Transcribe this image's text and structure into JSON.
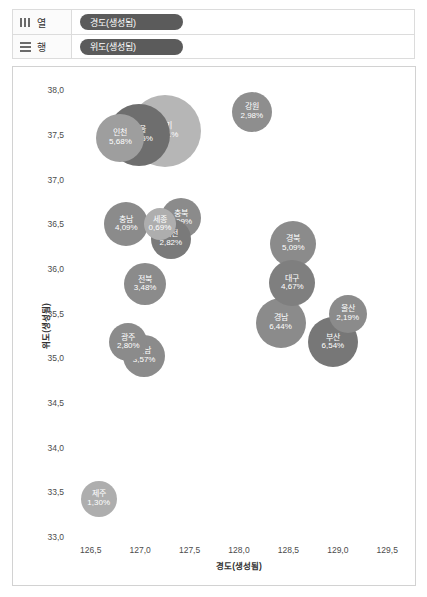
{
  "shelves": [
    {
      "icon": "columns-icon",
      "label": "열",
      "pill": "경도(생성됨)"
    },
    {
      "icon": "rows-icon",
      "label": "행",
      "pill": "위도(생성됨)"
    }
  ],
  "chart_data": {
    "type": "scatter",
    "title": "",
    "xlabel": "경도(생성됨)",
    "ylabel": "위도(생성됨)",
    "xlim": [
      126.3,
      129.7
    ],
    "ylim": [
      33.0,
      38.15
    ],
    "xticks": [
      "126,5",
      "127,0",
      "127,5",
      "128,0",
      "128,5",
      "129,0",
      "129,5"
    ],
    "xtick_values": [
      126.5,
      127.0,
      127.5,
      128.0,
      128.5,
      129.0,
      129.5
    ],
    "yticks": [
      "38,0",
      "37,5",
      "37,0",
      "36,5",
      "36,0",
      "35,5",
      "35,0",
      "34,5",
      "34,0",
      "33,5",
      "33,0"
    ],
    "ytick_values": [
      38.0,
      37.5,
      37.0,
      36.5,
      36.0,
      35.5,
      35.0,
      34.5,
      34.0,
      33.5,
      33.0
    ],
    "grid": false,
    "legend": "none",
    "size_encoding": "percent",
    "points": [
      {
        "label": "경기",
        "value": "25,91%",
        "pct": 25.91,
        "x": 127.25,
        "y": 37.55,
        "r": 36,
        "color": "#b6b6b6"
      },
      {
        "label": "서울",
        "value": "18,65%",
        "pct": 18.65,
        "x": 126.99,
        "y": 37.5,
        "r": 31,
        "color": "#6e6e6e"
      },
      {
        "label": "인천",
        "value": "5,68%",
        "pct": 5.68,
        "x": 126.8,
        "y": 37.47,
        "r": 24,
        "color": "#9e9e9e"
      },
      {
        "label": "강원",
        "value": "2,98%",
        "pct": 2.98,
        "x": 128.13,
        "y": 37.76,
        "r": 20,
        "color": "#8e8e8e"
      },
      {
        "label": "충남",
        "value": "4,09%",
        "pct": 4.09,
        "x": 126.86,
        "y": 36.5,
        "r": 22,
        "color": "#8b8b8b"
      },
      {
        "label": "세종",
        "value": "0,69%",
        "pct": 0.69,
        "x": 127.2,
        "y": 36.5,
        "r": 16,
        "color": "#aeaeae"
      },
      {
        "label": "충북",
        "value": "3,09%",
        "pct": 3.09,
        "x": 127.41,
        "y": 36.57,
        "r": 20,
        "color": "#8b8b8b"
      },
      {
        "label": "대전",
        "value": "2,82%",
        "pct": 2.82,
        "x": 127.31,
        "y": 36.34,
        "r": 20,
        "color": "#7a7a7a"
      },
      {
        "label": "전북",
        "value": "3,48%",
        "pct": 3.48,
        "x": 127.05,
        "y": 35.83,
        "r": 21,
        "color": "#8b8b8b"
      },
      {
        "label": "광주",
        "value": "2,80%",
        "pct": 2.8,
        "x": 126.88,
        "y": 35.18,
        "r": 19,
        "color": "#8b8b8b"
      },
      {
        "label": "전남",
        "value": "3,57%",
        "pct": 3.57,
        "x": 127.04,
        "y": 35.03,
        "r": 21,
        "color": "#8b8b8b"
      },
      {
        "label": "경북",
        "value": "5,09%",
        "pct": 5.09,
        "x": 128.55,
        "y": 36.28,
        "r": 23,
        "color": "#8b8b8b"
      },
      {
        "label": "대구",
        "value": "4,67%",
        "pct": 4.67,
        "x": 128.54,
        "y": 35.84,
        "r": 23,
        "color": "#7f7f7f"
      },
      {
        "label": "경남",
        "value": "6,44%",
        "pct": 6.44,
        "x": 128.42,
        "y": 35.4,
        "r": 25,
        "color": "#8b8b8b"
      },
      {
        "label": "울산",
        "value": "2,19%",
        "pct": 2.19,
        "x": 129.1,
        "y": 35.5,
        "r": 19,
        "color": "#8b8b8b"
      },
      {
        "label": "부산",
        "value": "6,54%",
        "pct": 6.54,
        "x": 128.95,
        "y": 35.18,
        "r": 25,
        "color": "#777777"
      },
      {
        "label": "제주",
        "value": "1,30%",
        "pct": 1.3,
        "x": 126.58,
        "y": 33.43,
        "r": 18,
        "color": "#aeaeae"
      }
    ]
  }
}
